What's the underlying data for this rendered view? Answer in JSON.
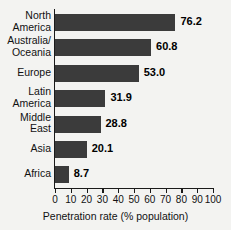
{
  "chart_data": {
    "type": "bar",
    "orientation": "horizontal",
    "title": "",
    "xlabel": "Penetration rate (% population)",
    "ylabel": "",
    "xlim": [
      0,
      100
    ],
    "xticks": [
      0,
      10,
      20,
      30,
      40,
      50,
      60,
      70,
      80,
      90,
      100
    ],
    "grid": false,
    "legend": null,
    "bar_color": "#3b3b3b",
    "background_color": "#f3f3f1",
    "categories": [
      "North America",
      "Australia/ Oceania",
      "Europe",
      "Latin America",
      "Middle East",
      "Asia",
      "Africa"
    ],
    "category_lines": [
      [
        "North",
        "America"
      ],
      [
        "Australia/",
        "Oceania"
      ],
      [
        "Europe",
        ""
      ],
      [
        "Latin",
        "America"
      ],
      [
        "Middle",
        "East"
      ],
      [
        "Asia",
        ""
      ],
      [
        "Africa",
        ""
      ]
    ],
    "values": [
      76.2,
      60.8,
      53.0,
      31.9,
      28.8,
      20.1,
      8.7
    ],
    "value_labels": [
      "76.2",
      "60.8",
      "53.0",
      "31.9",
      "28.8",
      "20.1",
      "8.7"
    ]
  },
  "axis": {
    "x_title": "Penetration rate (% population)",
    "tick_labels": [
      "0",
      "10",
      "20",
      "30",
      "40",
      "50",
      "60",
      "70",
      "80",
      "90",
      "100"
    ]
  },
  "cropped_title": "·        ·"
}
